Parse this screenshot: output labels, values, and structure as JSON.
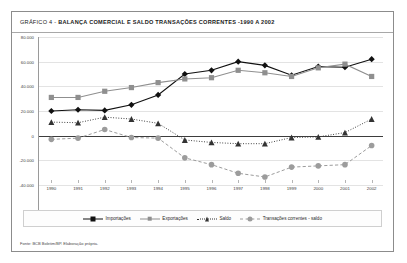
{
  "figure": {
    "title_lead": "GRÁFICO 4 - ",
    "title_main": "BALANÇA COMERCIAL E SALDO TRANSAÇÕES CORRENTES -1990 A 2002",
    "source": "Fonte: BCB Boletim/BP. Elaboração própria."
  },
  "legend": {
    "position": "bottom",
    "items": [
      {
        "label": "Importações",
        "marker": "diamond",
        "color": "#111111",
        "line": "solid"
      },
      {
        "label": "Exportações",
        "marker": "square",
        "color": "#8f8f8f",
        "line": "solid"
      },
      {
        "label": "Saldo",
        "marker": "triangle",
        "color": "#333333",
        "line": "dotted"
      },
      {
        "label": "Transações correntes - saldo",
        "marker": "circle",
        "color": "#9c9c9c",
        "line": "dashed"
      }
    ]
  },
  "chart_data": {
    "type": "line",
    "title": "GRÁFICO 4 - BALANÇA COMERCIAL E SALDO TRANSAÇÕES CORRENTES -1990 A 2002",
    "xlabel": "",
    "ylabel": "",
    "grid": true,
    "legend_position": "bottom",
    "categories": [
      "1990",
      "1991",
      "1992",
      "1993",
      "1994",
      "1995",
      "1996",
      "1997",
      "1998",
      "1999",
      "2000",
      "2001",
      "2002"
    ],
    "x": [
      1990,
      1991,
      1992,
      1993,
      1994,
      1995,
      1996,
      1997,
      1998,
      1999,
      2000,
      2001,
      2002
    ],
    "ylim": [
      -40000,
      80000
    ],
    "ytick_labels": [
      "80.000",
      "60.000",
      "40.000",
      "20.000",
      "0",
      "-20.000",
      "-40.000"
    ],
    "yticks": [
      80000,
      60000,
      40000,
      20000,
      0,
      -20000,
      -40000
    ],
    "series": [
      {
        "name": "Importações",
        "marker": "diamond",
        "color": "#111111",
        "line": "solid",
        "values": [
          20000,
          21000,
          20500,
          25000,
          33000,
          50000,
          53000,
          60000,
          57000,
          49000,
          56000,
          55500,
          62000
        ]
      },
      {
        "name": "Exportações",
        "marker": "square",
        "color": "#8f8f8f",
        "line": "solid",
        "values": [
          31000,
          31000,
          36000,
          39000,
          43000,
          46000,
          47000,
          53000,
          51000,
          48000,
          55000,
          58000,
          48000
        ]
      },
      {
        "name": "Saldo",
        "marker": "triangle",
        "color": "#333333",
        "line": "dotted",
        "values": [
          11000,
          10500,
          15000,
          13500,
          10000,
          -3500,
          -5500,
          -6500,
          -6500,
          -1500,
          -1000,
          2500,
          13500
        ]
      },
      {
        "name": "Transações correntes - saldo",
        "marker": "circle",
        "color": "#9c9c9c",
        "line": "dashed",
        "values": [
          -3000,
          -2000,
          5000,
          -1500,
          -2000,
          -18000,
          -23500,
          -30500,
          -33500,
          -25500,
          -24500,
          -23500,
          -8000
        ]
      }
    ]
  }
}
